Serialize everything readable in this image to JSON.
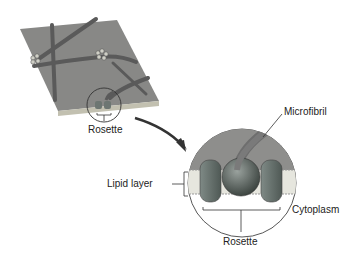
{
  "diagram": {
    "labels": {
      "rosette_top": "Rosette",
      "microfibril": "Microfibril",
      "lipid_layer": "Lipid layer",
      "cytoplasm": "Cytoplasm",
      "rosette_bottom": "Rosette"
    },
    "colors": {
      "membrane_surface": "#8a8a8a",
      "membrane_edge": "#b8b8a8",
      "fibril": "#6e6e6e",
      "rosette_subunit": "#5e6a66",
      "lipid": "#e6e6de",
      "arrow": "#333333"
    }
  }
}
